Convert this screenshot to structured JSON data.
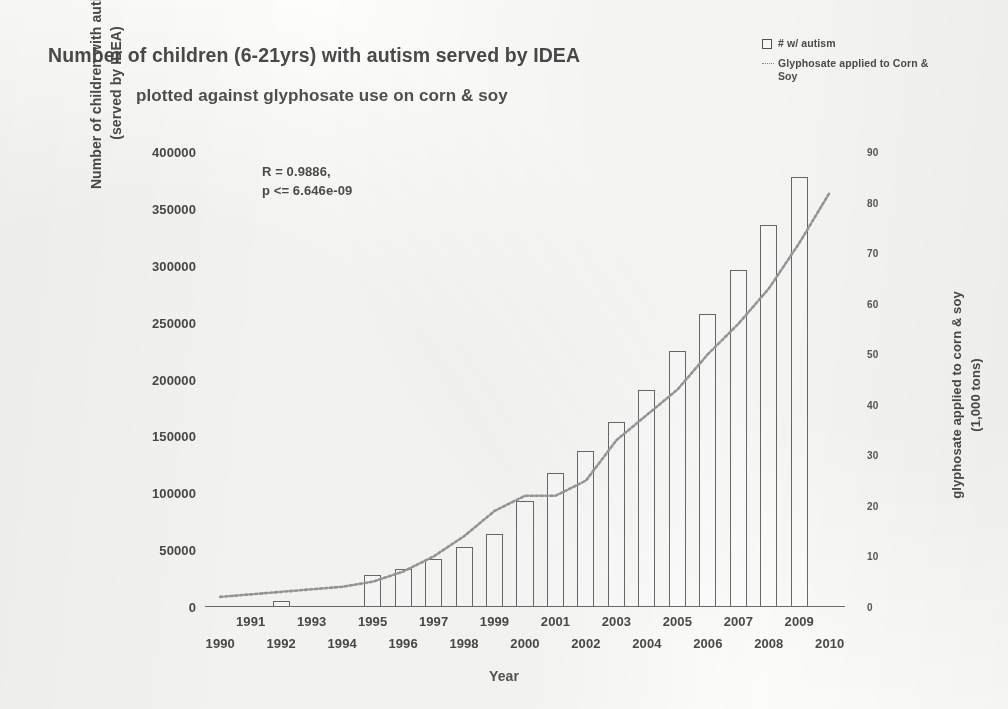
{
  "title": {
    "line1": "Number of children (6-21yrs) with autism served by IDEA",
    "line2": "plotted against glyphosate use on corn & soy"
  },
  "legend": {
    "position": "top-right",
    "items": [
      {
        "label": "# w/ autism",
        "marker": "open-square",
        "color": "#6a6a6a"
      },
      {
        "label": "Glyphosate applied to\nCorn & Soy",
        "marker": "dotted-line",
        "color": "#8a8a8a"
      }
    ]
  },
  "annotation": {
    "text": "R = 0.9886,\np <= 6.646e-09",
    "r_value": "R = 0.9886,",
    "p_value": "p <= 6.646e-09"
  },
  "axes": {
    "x_label": "Year",
    "y_left_label": "Number of children with autism\n(served by IDEA)",
    "y_right_label": "glyphosate applied to corn & soy\n(1,000 tons)"
  },
  "chart_data": {
    "type": "bar",
    "title": "Number of children (6-21yrs) with autism served by IDEA plotted against glyphosate use on corn & soy",
    "xlabel": "Year",
    "ylabel": "Number of children with autism (served by IDEA)",
    "y2label": "glyphosate applied to corn & soy (1,000 tons)",
    "grid": false,
    "legend_position": "top-right",
    "categories": [
      1990,
      1991,
      1992,
      1993,
      1994,
      1995,
      1996,
      1997,
      1998,
      1999,
      2000,
      2001,
      2002,
      2003,
      2004,
      2005,
      2006,
      2007,
      2008,
      2009,
      2010
    ],
    "x_tick_labels": [
      "1990",
      "1991",
      "1992",
      "1993",
      "1994",
      "1995",
      "1996",
      "1997",
      "1998",
      "1999",
      "2000",
      "2001",
      "2002",
      "2003",
      "2004",
      "2005",
      "2006",
      "2007",
      "2008",
      "2009",
      "2010"
    ],
    "ylim": [
      0,
      400000
    ],
    "y_ticks": [
      0,
      50000,
      100000,
      150000,
      200000,
      250000,
      300000,
      350000,
      400000
    ],
    "y_tick_labels": [
      "0",
      "50000",
      "100000",
      "150000",
      "200000",
      "250000",
      "300000",
      "350000",
      "400000"
    ],
    "y2lim": [
      0,
      90
    ],
    "y2_ticks": [
      0,
      10,
      20,
      30,
      40,
      50,
      60,
      70,
      80,
      90
    ],
    "y2_tick_labels": [
      "0",
      "10",
      "20",
      "30",
      "40",
      "50",
      "60",
      "70",
      "80",
      "90"
    ],
    "series": [
      {
        "name": "# w/ autism",
        "type": "bar",
        "axis": "left",
        "units": "children",
        "values": [
          null,
          null,
          5000,
          null,
          null,
          28000,
          33000,
          42000,
          53000,
          64000,
          93000,
          118000,
          137000,
          163000,
          191000,
          225000,
          258000,
          296000,
          336000,
          378000,
          null
        ]
      },
      {
        "name": "Glyphosate applied to Corn & Soy",
        "type": "line",
        "axis": "right",
        "units": "1,000 tons",
        "style": "dotted",
        "values": [
          2,
          2.5,
          3,
          3.5,
          4,
          5,
          7,
          10,
          14,
          19,
          22,
          22,
          25,
          33,
          38,
          43,
          50,
          56,
          63,
          72,
          82
        ]
      }
    ]
  }
}
